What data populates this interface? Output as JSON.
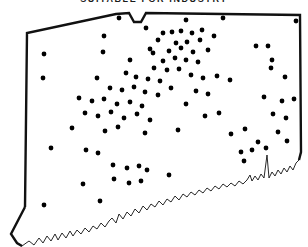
{
  "map": {
    "title": "SUITABLE FOR INDUSTRY",
    "region_name": "Connecticut",
    "outline_color": "#111111",
    "coastline_color": "#111111",
    "marker_color": "#000000",
    "background_color": "#ffffff",
    "marker_radius": 2.4,
    "marker_count": 92,
    "border_width_heavy": 2.4,
    "border_width_fine": 0.9,
    "state_outline_path": "M 25 207 L 27 33 L 116 14 L 129 13 L 134 22 L 141 22 L 146 13 L 300 15 L 301 152 L 299 160",
    "panhandle_path": "M 25 207 L 11 234 L 17 243 L 22 246",
    "west_border_path": "M 27 33 L 25 207",
    "coastline_path": "M 22 246 L 29 241 L 34 245 L 39 238 L 43 243 L 47 236 L 51 241 L 55 234 L 58 240 L 62 233 L 66 238 L 70 231 L 73 236 L 77 230 L 81 234 L 85 228 L 89 232 L 93 226 L 97 229 L 101 223 L 105 227 L 109 221 L 112 218 L 116 223 L 119 214 L 123 219 L 127 212 L 131 216 L 135 209 L 139 213 L 143 206 L 147 210 L 151 204 L 155 207 L 159 201 L 163 205 L 167 199 L 171 202 L 175 196 L 179 200 L 183 194 L 187 197 L 191 192 L 195 195 L 199 190 L 203 193 L 207 188 L 211 191 L 215 186 L 219 189 L 223 184 L 227 187 L 231 183 L 235 186 L 239 181 L 243 184 L 247 180 L 250 175 L 252 181 L 255 176 L 258 180 L 261 174 L 264 178 L 267 155 L 269 178 L 272 172 L 275 176 L 278 170 L 281 174 L 284 168 L 287 172 L 290 166 L 293 170 L 296 163 L 299 160",
    "northern_notch_label": "Southwick Jog",
    "markers": [
      {
        "x": 119,
        "y": 18
      },
      {
        "x": 186,
        "y": 20
      },
      {
        "x": 223,
        "y": 18
      },
      {
        "x": 296,
        "y": 21
      },
      {
        "x": 146,
        "y": 28
      },
      {
        "x": 202,
        "y": 30
      },
      {
        "x": 163,
        "y": 33
      },
      {
        "x": 172,
        "y": 32
      },
      {
        "x": 181,
        "y": 31
      },
      {
        "x": 192,
        "y": 33
      },
      {
        "x": 104,
        "y": 36
      },
      {
        "x": 214,
        "y": 36
      },
      {
        "x": 158,
        "y": 40
      },
      {
        "x": 200,
        "y": 40
      },
      {
        "x": 176,
        "y": 43
      },
      {
        "x": 187,
        "y": 42
      },
      {
        "x": 44,
        "y": 54
      },
      {
        "x": 103,
        "y": 52
      },
      {
        "x": 150,
        "y": 49
      },
      {
        "x": 153,
        "y": 53
      },
      {
        "x": 169,
        "y": 51
      },
      {
        "x": 181,
        "y": 48
      },
      {
        "x": 193,
        "y": 52
      },
      {
        "x": 208,
        "y": 50
      },
      {
        "x": 256,
        "y": 46
      },
      {
        "x": 268,
        "y": 46
      },
      {
        "x": 272,
        "y": 60
      },
      {
        "x": 163,
        "y": 61
      },
      {
        "x": 175,
        "y": 58
      },
      {
        "x": 186,
        "y": 60
      },
      {
        "x": 198,
        "y": 62
      },
      {
        "x": 130,
        "y": 60
      },
      {
        "x": 271,
        "y": 68
      },
      {
        "x": 154,
        "y": 68
      },
      {
        "x": 167,
        "y": 70
      },
      {
        "x": 179,
        "y": 69
      },
      {
        "x": 43,
        "y": 78
      },
      {
        "x": 97,
        "y": 78
      },
      {
        "x": 126,
        "y": 73
      },
      {
        "x": 136,
        "y": 77
      },
      {
        "x": 148,
        "y": 79
      },
      {
        "x": 160,
        "y": 81
      },
      {
        "x": 191,
        "y": 75
      },
      {
        "x": 203,
        "y": 78
      },
      {
        "x": 217,
        "y": 76
      },
      {
        "x": 230,
        "y": 80
      },
      {
        "x": 285,
        "y": 77
      },
      {
        "x": 110,
        "y": 88
      },
      {
        "x": 122,
        "y": 90
      },
      {
        "x": 134,
        "y": 87
      },
      {
        "x": 145,
        "y": 92
      },
      {
        "x": 158,
        "y": 95
      },
      {
        "x": 171,
        "y": 88
      },
      {
        "x": 196,
        "y": 91
      },
      {
        "x": 208,
        "y": 94
      },
      {
        "x": 79,
        "y": 98
      },
      {
        "x": 92,
        "y": 101
      },
      {
        "x": 104,
        "y": 99
      },
      {
        "x": 117,
        "y": 104
      },
      {
        "x": 130,
        "y": 102
      },
      {
        "x": 142,
        "y": 106
      },
      {
        "x": 186,
        "y": 104
      },
      {
        "x": 264,
        "y": 97
      },
      {
        "x": 282,
        "y": 101
      },
      {
        "x": 294,
        "y": 99
      },
      {
        "x": 85,
        "y": 113
      },
      {
        "x": 98,
        "y": 116
      },
      {
        "x": 111,
        "y": 112
      },
      {
        "x": 124,
        "y": 118
      },
      {
        "x": 137,
        "y": 114
      },
      {
        "x": 150,
        "y": 120
      },
      {
        "x": 205,
        "y": 116
      },
      {
        "x": 219,
        "y": 113
      },
      {
        "x": 273,
        "y": 114
      },
      {
        "x": 286,
        "y": 118
      },
      {
        "x": 72,
        "y": 128
      },
      {
        "x": 105,
        "y": 131
      },
      {
        "x": 118,
        "y": 127
      },
      {
        "x": 145,
        "y": 133
      },
      {
        "x": 178,
        "y": 130
      },
      {
        "x": 231,
        "y": 134
      },
      {
        "x": 245,
        "y": 129
      },
      {
        "x": 278,
        "y": 132
      },
      {
        "x": 258,
        "y": 142
      },
      {
        "x": 287,
        "y": 141
      },
      {
        "x": 51,
        "y": 148
      },
      {
        "x": 86,
        "y": 150
      },
      {
        "x": 98,
        "y": 153
      },
      {
        "x": 241,
        "y": 152
      },
      {
        "x": 252,
        "y": 150
      },
      {
        "x": 266,
        "y": 148
      },
      {
        "x": 113,
        "y": 165
      },
      {
        "x": 127,
        "y": 168
      },
      {
        "x": 139,
        "y": 166
      },
      {
        "x": 147,
        "y": 170
      },
      {
        "x": 244,
        "y": 161
      },
      {
        "x": 83,
        "y": 184
      },
      {
        "x": 114,
        "y": 179
      },
      {
        "x": 129,
        "y": 183
      },
      {
        "x": 141,
        "y": 181
      },
      {
        "x": 169,
        "y": 175
      },
      {
        "x": 44,
        "y": 205
      },
      {
        "x": 100,
        "y": 201
      }
    ]
  }
}
